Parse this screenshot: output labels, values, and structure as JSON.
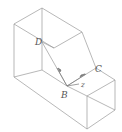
{
  "diagram": {
    "type": "isometric-solid",
    "line_color": "#9a9a9a",
    "label_color": "#555555",
    "points": {
      "D": {
        "label": "D"
      },
      "C": {
        "label": "C"
      },
      "B": {
        "label": "B"
      }
    },
    "axis_label": "z"
  }
}
